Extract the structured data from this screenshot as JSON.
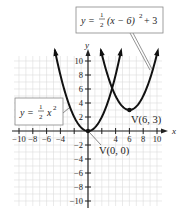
{
  "chart_data": {
    "type": "line",
    "title": "",
    "xlabel": "x",
    "ylabel": "y",
    "xlim": [
      -11,
      11
    ],
    "ylim": [
      -11,
      11
    ],
    "grid": true,
    "x_ticks": [
      -10,
      -8,
      -6,
      -4,
      4,
      6,
      8,
      10
    ],
    "x_tick_labels": [
      "−10",
      "−8",
      "−6",
      "−4",
      "4",
      "6",
      "8",
      "10"
    ],
    "y_ticks": [
      10,
      8,
      6,
      4,
      2,
      -2,
      -4,
      -6,
      -8,
      -10
    ],
    "y_tick_labels": [
      "10",
      "8",
      "6",
      "4",
      "2",
      "−2",
      "−4",
      "−6",
      "−8",
      "−10"
    ],
    "series": [
      {
        "name": "y = 1/2 x^2",
        "equation": "y = (1/2)x^2",
        "vertex": [
          0,
          0
        ],
        "vertex_label": "V(0, 0)",
        "x": [
          -5,
          -4,
          -3,
          -2,
          -1,
          0,
          1,
          2,
          3,
          4,
          5
        ],
        "y": [
          12.5,
          8,
          4.5,
          2,
          0.5,
          0,
          0.5,
          2,
          4.5,
          8,
          12.5
        ]
      },
      {
        "name": "y = 1/2 (x-6)^2 + 3",
        "equation": "y = (1/2)(x - 6)^2 + 3",
        "vertex": [
          6,
          3
        ],
        "vertex_label": "V(6, 3)",
        "x": [
          1.5,
          2,
          3,
          4,
          5,
          6,
          7,
          8,
          9,
          10,
          10.5
        ],
        "y": [
          13.1,
          11,
          7.5,
          5,
          3.5,
          3,
          3.5,
          5,
          7.5,
          11,
          13.1
        ]
      }
    ],
    "annotations": [
      {
        "text": "y = ½ x²",
        "points_to": "left branch of y = 1/2 x^2"
      },
      {
        "text": "y = ½(x − 6)² + 3",
        "points_to": "right branch of shifted parabola"
      },
      {
        "text": "V(0, 0)",
        "at": [
          0,
          0
        ]
      },
      {
        "text": "V(6, 3)",
        "at": [
          6,
          3
        ]
      }
    ]
  },
  "labels": {
    "axis_x": "x",
    "axis_y": "y",
    "vertex1": "V(0, 0)",
    "vertex2": "V(6, 3)",
    "eq1_lhs": "y =",
    "eq1_rhs": "x",
    "eq1_exp": "2",
    "eq2_lhs": "y =",
    "eq2_rhs": "(x − 6)",
    "eq2_exp": "2",
    "eq2_tail": "+ 3",
    "frac_num": "1",
    "frac_den": "2"
  }
}
